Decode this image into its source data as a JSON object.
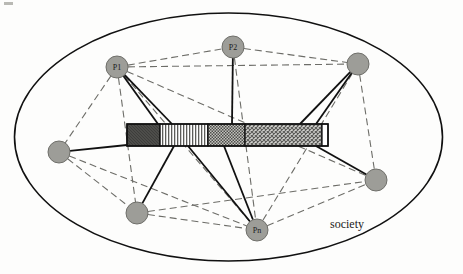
{
  "figure": {
    "type": "diagram",
    "title": "society",
    "boundary": {
      "name": "society-ellipse",
      "label": "society",
      "cx": 228.5,
      "cy": 137,
      "rx": 214,
      "ry": 124,
      "stroke": "#111111",
      "stroke_width": 1.6,
      "fill": "none",
      "label_x": 330,
      "label_y": 228
    },
    "artifact": {
      "name": "shared-artifact-bar",
      "x": 127,
      "y": 124,
      "width": 201,
      "height": 22,
      "stroke": "#111111",
      "segments": [
        {
          "id": "seg-dark",
          "pattern": "solid-dark",
          "x": 127,
          "width": 33,
          "color": "#4a4a4a"
        },
        {
          "id": "seg-vertical-stripes",
          "pattern": "vertical-stripes",
          "x": 160,
          "width": 48,
          "color": "#8a8a8a"
        },
        {
          "id": "seg-dense-dots",
          "pattern": "dense-dots",
          "x": 208,
          "width": 37,
          "color": "#7e7e7e"
        },
        {
          "id": "seg-crosshatch",
          "pattern": "crosshatch",
          "x": 245,
          "width": 77,
          "color": "#9a9a9a"
        },
        {
          "id": "seg-white-tip",
          "pattern": "blank",
          "x": 322,
          "width": 6,
          "color": "#ffffff"
        }
      ]
    },
    "nodes": [
      {
        "id": "p1",
        "label": "P1",
        "cx": 117,
        "cy": 67,
        "r": 11,
        "fill": "#9d9d98",
        "stroke": "#6f6f6a"
      },
      {
        "id": "p2",
        "label": "P2",
        "cx": 233,
        "cy": 47,
        "r": 11,
        "fill": "#9d9d98",
        "stroke": "#6f6f6a"
      },
      {
        "id": "pn",
        "label": "Pn",
        "cx": 257,
        "cy": 230,
        "r": 11,
        "fill": "#9d9d98",
        "stroke": "#6f6f6a"
      },
      {
        "id": "n-top-right",
        "label": "",
        "cx": 358,
        "cy": 64,
        "r": 11,
        "fill": "#9d9d98",
        "stroke": "#6f6f6a"
      },
      {
        "id": "n-left",
        "label": "",
        "cx": 59,
        "cy": 152,
        "r": 11,
        "fill": "#9d9d98",
        "stroke": "#6f6f6a"
      },
      {
        "id": "n-bottom-left",
        "label": "",
        "cx": 137,
        "cy": 213,
        "r": 11,
        "fill": "#9d9d98",
        "stroke": "#6f6f6a"
      },
      {
        "id": "n-bottom-right",
        "label": "",
        "cx": 376,
        "cy": 180,
        "r": 11,
        "fill": "#9d9d98",
        "stroke": "#6f6f6a"
      }
    ],
    "artifact_links": [
      {
        "id": "link-p1-a",
        "from": "p1",
        "to_x": 158,
        "to_y": 124
      },
      {
        "id": "link-p1-b",
        "from": "p1",
        "to_x": 172,
        "to_y": 124
      },
      {
        "id": "link-p2",
        "from": "p2",
        "to_x": 232,
        "to_y": 124
      },
      {
        "id": "link-top-right-a",
        "from": "n-top-right",
        "to_x": 300,
        "to_y": 124
      },
      {
        "id": "link-top-right-b",
        "from": "n-top-right",
        "to_x": 316,
        "to_y": 124
      },
      {
        "id": "link-left",
        "from": "n-left",
        "to_x": 127,
        "to_y": 145
      },
      {
        "id": "link-bottom-left",
        "from": "n-bottom-left",
        "to_x": 174,
        "to_y": 146
      },
      {
        "id": "link-pn-a",
        "from": "pn",
        "to_x": 188,
        "to_y": 146
      },
      {
        "id": "link-pn-b",
        "from": "pn",
        "to_x": 224,
        "to_y": 146
      },
      {
        "id": "link-bottom-right",
        "from": "n-bottom-right",
        "to_x": 316,
        "to_y": 146
      }
    ],
    "social_links": [
      {
        "id": "soc-p1-p2",
        "from": "p1",
        "to": "p2"
      },
      {
        "id": "soc-p1-topright",
        "from": "p1",
        "to": "n-top-right"
      },
      {
        "id": "soc-p1-pn",
        "from": "p1",
        "to": "pn"
      },
      {
        "id": "soc-p1-bottomleft",
        "from": "p1",
        "to": "n-bottom-left"
      },
      {
        "id": "soc-p1-left",
        "from": "p1",
        "to": "n-left"
      },
      {
        "id": "soc-p1-bottomright",
        "from": "p1",
        "to": "n-bottom-right"
      },
      {
        "id": "soc-p2-topright",
        "from": "p2",
        "to": "n-top-right"
      },
      {
        "id": "soc-p2-pn",
        "from": "p2",
        "to": "pn"
      },
      {
        "id": "soc-topright-pn",
        "from": "n-top-right",
        "to": "pn"
      },
      {
        "id": "soc-topright-bottomright",
        "from": "n-top-right",
        "to": "n-bottom-right"
      },
      {
        "id": "soc-left-pn",
        "from": "n-left",
        "to": "pn"
      },
      {
        "id": "soc-left-bottomleft",
        "from": "n-left",
        "to": "n-bottom-left"
      },
      {
        "id": "soc-bottomleft-pn",
        "from": "n-bottom-left",
        "to": "pn"
      },
      {
        "id": "soc-pn-bottomright",
        "from": "pn",
        "to": "n-bottom-right"
      },
      {
        "id": "soc-bottomleft-bottomright",
        "from": "n-bottom-left",
        "to": "n-bottom-right"
      }
    ],
    "style": {
      "solid_stroke": "#111111",
      "solid_width": 1.8,
      "dashed_stroke": "#6d6d68",
      "dashed_width": 1.1,
      "dash_pattern": "7,4"
    }
  }
}
